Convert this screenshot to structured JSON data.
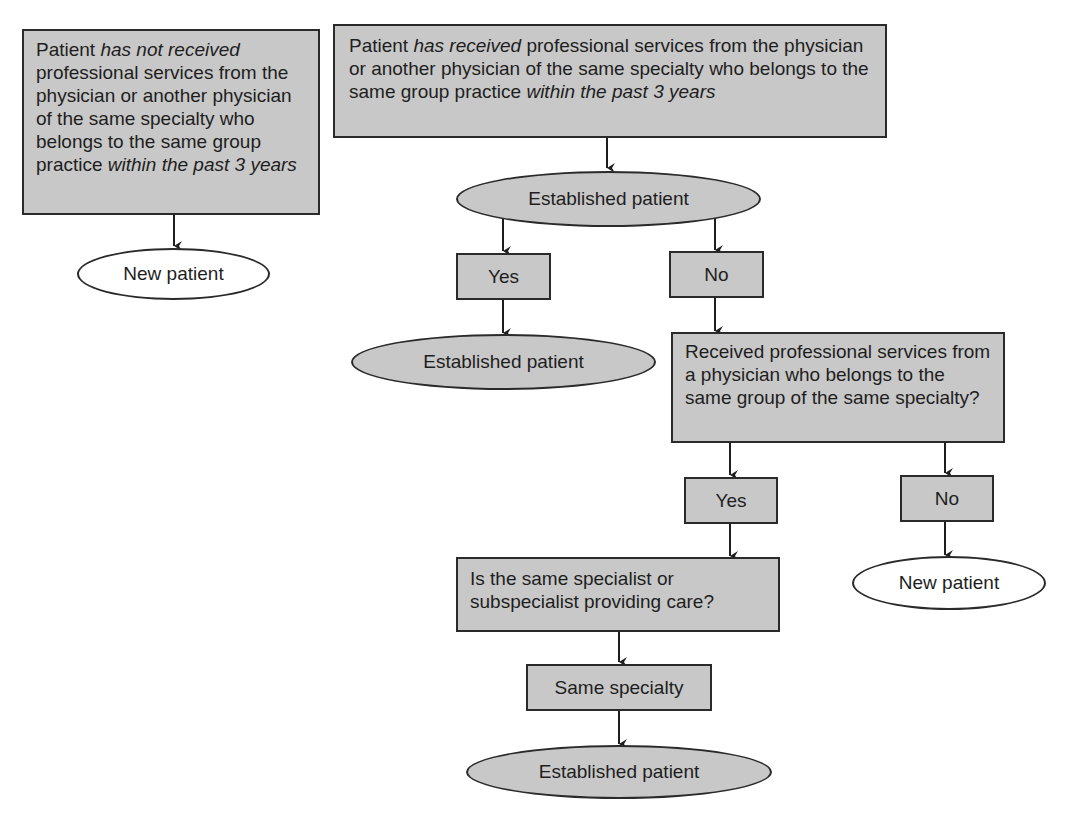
{
  "colors": {
    "box_fill": "#c8c8c8",
    "stroke": "#2a2a2a",
    "text": "#1e1e1e"
  },
  "left_branch": {
    "condition": {
      "prefix": "Patient ",
      "emphasis": "has not received",
      "middle": " professional services from the physician or another physician of the same specialty who belongs to the same group practice ",
      "suffix_emphasis": "within the past 3 years"
    },
    "result": "New patient"
  },
  "right_branch": {
    "condition": {
      "prefix": "Patient ",
      "emphasis": "has received",
      "middle": " professional services from the physician or another physician of the same specialty who belongs to the same group practice ",
      "suffix_emphasis": "within the past 3 years"
    },
    "established": "Established patient",
    "yes_label": "Yes",
    "no_label": "No",
    "yes_result": "Established patient",
    "question2": "Received professional services from a physician who belongs to the same group of the same specialty?",
    "q2_yes_label": "Yes",
    "q2_no_label": "No",
    "q2_no_result": "New patient",
    "question3": "Is the same specialist or subspecialist providing care?",
    "q3_answer": "Same specialty",
    "q3_result": "Established patient"
  }
}
